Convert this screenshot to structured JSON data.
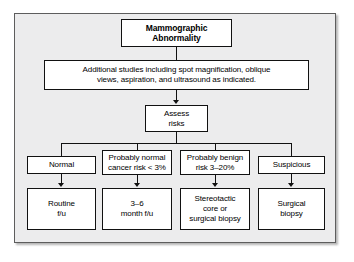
{
  "figure": {
    "panel_background": "#ececed",
    "box_background": "#ffffff",
    "line_color": "#111111",
    "frame_color": "#5d5d5d"
  },
  "nodes": {
    "root": {
      "id": "mammographic-abnormality",
      "line1": "Mammographic",
      "line2": "Abnormality",
      "bold": true
    },
    "additional_studies": {
      "id": "additional-studies",
      "line1": "Additional studies including spot magnification, oblique",
      "line2": "views, aspiration, and ultrasound as indicated."
    },
    "assess_risks": {
      "id": "assess-risks",
      "line1": "Assess",
      "line2": "risks"
    },
    "branches": [
      {
        "id": "normal",
        "line1": "Normal",
        "line2": "",
        "outcome": {
          "id": "routine-fu",
          "line1": "Routine",
          "line2": "f/u",
          "line3": ""
        }
      },
      {
        "id": "probably-normal",
        "line1": "Probably normal",
        "line2": "cancer risk < 3%",
        "outcome": {
          "id": "three-six-month-fu",
          "line1": "3–6",
          "line2": "month f/u",
          "line3": ""
        }
      },
      {
        "id": "probably-benign",
        "line1": "Probably benign",
        "line2": "risk 3–20%",
        "outcome": {
          "id": "stereotactic-core-or-surgical-biopsy",
          "line1": "Stereotactic",
          "line2": "core or",
          "line3": "surgical biopsy"
        }
      },
      {
        "id": "suspicious",
        "line1": "Suspicious",
        "line2": "",
        "outcome": {
          "id": "surgical-biopsy",
          "line1": "Surgical",
          "line2": "biopsy",
          "line3": ""
        }
      }
    ]
  }
}
